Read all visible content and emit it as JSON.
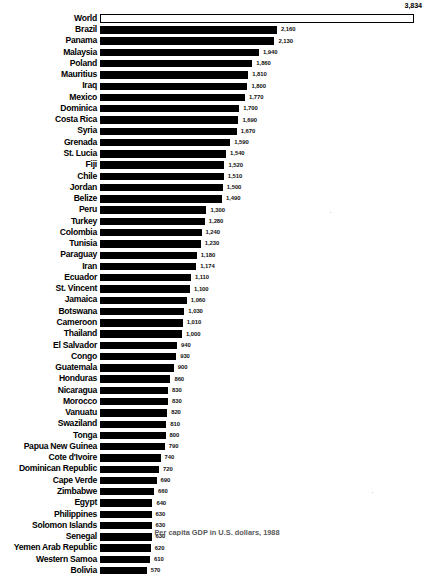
{
  "chart_data": {
    "type": "bar",
    "orientation": "horizontal",
    "title": "",
    "xlabel": "",
    "ylabel": "",
    "caption": "Per capita GDP in U.S. dollars, 1988",
    "grid": false,
    "legend": null,
    "xlim": [
      0,
      3834
    ],
    "value_format": "comma-separated integers",
    "highlight_row": "World",
    "categories": [
      "World",
      "Brazil",
      "Panama",
      "Malaysia",
      "Poland",
      "Mauritius",
      "Iraq",
      "Mexico",
      "Dominica",
      "Costa Rica",
      "Syria",
      "Grenada",
      "St. Lucia",
      "Fiji",
      "Chile",
      "Jordan",
      "Belize",
      "Peru",
      "Turkey",
      "Colombia",
      "Tunisia",
      "Paraguay",
      "Iran",
      "Ecuador",
      "St. Vincent",
      "Jamaica",
      "Botswana",
      "Cameroon",
      "Thailand",
      "El Salvador",
      "Congo",
      "Guatemala",
      "Honduras",
      "Nicaragua",
      "Morocco",
      "Vanuatu",
      "Swaziland",
      "Tonga",
      "Papua New Guinea",
      "Cote d'Ivoire",
      "Dominican Republic",
      "Cape Verde",
      "Zimbabwe",
      "Egypt",
      "Philippines",
      "Solomon Islands",
      "Senegal",
      "Yemen Arab Republic",
      "Western Samoa",
      "Bolivia"
    ],
    "values": [
      3834,
      2160,
      2130,
      1940,
      1860,
      1810,
      1800,
      1770,
      1700,
      1690,
      1670,
      1590,
      1540,
      1520,
      1510,
      1500,
      1490,
      1300,
      1280,
      1240,
      1230,
      1180,
      1174,
      1110,
      1100,
      1060,
      1030,
      1010,
      1000,
      940,
      930,
      900,
      860,
      830,
      830,
      820,
      810,
      800,
      790,
      740,
      720,
      690,
      660,
      640,
      630,
      630,
      630,
      620,
      610,
      570
    ],
    "value_labels": [
      "3,834",
      "2,160",
      "2,130",
      "1,940",
      "1,860",
      "1,810",
      "1,800",
      "1,770",
      "1,700",
      "1,690",
      "1,670",
      "1,590",
      "1,540",
      "1,520",
      "1,510",
      "1,500",
      "1,490",
      "1,300",
      "1,280",
      "1,240",
      "1,230",
      "1,180",
      "1,174",
      "1,110",
      "1,100",
      "1,060",
      "1,030",
      "1,010",
      "1,000",
      "940",
      "930",
      "900",
      "860",
      "830",
      "830",
      "820",
      "810",
      "800",
      "790",
      "740",
      "720",
      "690",
      "660",
      "640",
      "630",
      "630",
      "630",
      "620",
      "610",
      "570"
    ],
    "colors": {
      "bar_fill": "#000000",
      "bar_world_fill": "#ffffff",
      "bar_world_stroke": "#000000",
      "text": "#000000",
      "background": "#ffffff"
    }
  }
}
